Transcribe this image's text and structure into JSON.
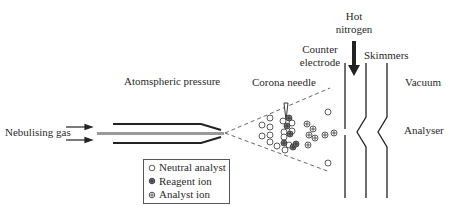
{
  "diagram": {
    "type": "APCI ion source schematic",
    "labels": {
      "nebulising_gas": "Nebulising gas",
      "atmospheric_pressure": "Atomspheric pressure",
      "corona_needle": "Corona needle",
      "counter_electrode_line1": "Counter",
      "counter_electrode_line2": "electrode",
      "hot_nitrogen_line1": "Hot",
      "hot_nitrogen_line2": "nitrogen",
      "skimmers": "Skimmers",
      "vacuum": "Vacuum",
      "analyser": "Analyser"
    },
    "legend": {
      "items": [
        {
          "symbol": "open-circle",
          "label": "Neutral analyst"
        },
        {
          "symbol": "dark-crossed-circle",
          "label": "Reagent ion"
        },
        {
          "symbol": "crossed-circle",
          "label": "Analyst ion"
        }
      ]
    },
    "colors": {
      "line": "#222222",
      "capillary": "#9a9a9a",
      "dashed": "#555555"
    }
  }
}
